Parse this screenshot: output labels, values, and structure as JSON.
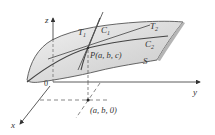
{
  "diagram": {
    "type": "surface-with-tangent-lines",
    "colors": {
      "surface_fill": "#d9d9d9",
      "surface_edge": "#555555",
      "curve": "#444444",
      "axis": "#333333",
      "dashed": "#555555",
      "text": "#333333"
    },
    "axes": {
      "z_label": "z",
      "y_label": "y",
      "x_label": "x",
      "origin_label": "0"
    },
    "labels": {
      "T1": "T",
      "T1_sub": "1",
      "T2": "T",
      "T2_sub": "2",
      "C1": "C",
      "C1_sub": "1",
      "C2": "C",
      "C2_sub": "2",
      "point_P": "P(a, b, c)",
      "surface": "S",
      "point_base": "(a, b, 0)"
    }
  }
}
